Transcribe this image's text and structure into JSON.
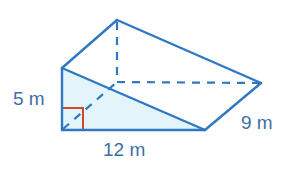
{
  "figure": {
    "type": "triangular-prism",
    "colors": {
      "edge": "#2f78c4",
      "fill": "#e3f4fa",
      "right_angle_marker": "#d2462d",
      "label_text": "#3d6fa8"
    },
    "labels": {
      "height": "5 m",
      "base": "12 m",
      "length": "9 m"
    },
    "vertices": {
      "front_top": [
        62,
        68
      ],
      "front_bottom_left": [
        62,
        130
      ],
      "front_bottom_right": [
        205,
        130
      ],
      "back_top": [
        117,
        20
      ],
      "back_bottom_left": [
        117,
        82
      ],
      "back_bottom_right": [
        261,
        83
      ]
    },
    "dimensions": {
      "triangle_height_m": 5,
      "triangle_base_m": 12,
      "prism_length_m": 9
    }
  }
}
